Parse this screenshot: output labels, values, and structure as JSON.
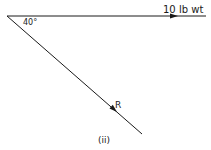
{
  "diagram": {
    "caption": "(ii)",
    "angle_label": "40°",
    "force_horizontal": {
      "label": "10  lb wt"
    },
    "force_resultant": {
      "label": "R"
    },
    "colors": {
      "line": "#1a1a1a",
      "background": "#ffffff"
    }
  }
}
